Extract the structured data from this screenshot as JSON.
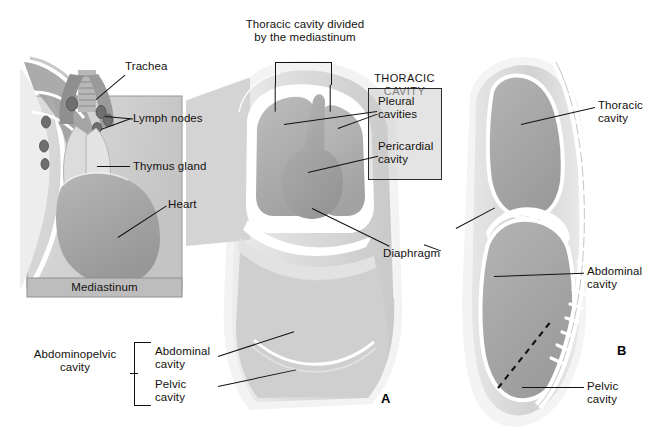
{
  "figure": {
    "title_note": "Body cavities: thoracic, abdominopelvic and mediastinum",
    "panel_a_letter": "A",
    "panel_b_letter": "B"
  },
  "mediastinum_inset": {
    "caption": "Mediastinum",
    "labels": {
      "trachea": "Trachea",
      "lymph_nodes": "Lymph nodes",
      "thymus_gland": "Thymus gland",
      "heart": "Heart"
    }
  },
  "panel_a": {
    "bracket_label": "Thoracic cavity divided\nby the mediastinum",
    "thoracic_box": {
      "heading": "THORACIC CAVITY",
      "items": [
        "Pleural\ncavities",
        "Pericardial\ncavity"
      ]
    },
    "diaphragm_label": "Diaphragm",
    "abdominopelvic": {
      "group_label": "Abdominopelvic\ncavity",
      "sub_labels": [
        "Abdominal\ncavity",
        "Pelvic\ncavity"
      ]
    }
  },
  "panel_b": {
    "labels": [
      "Thoracic\ncavity",
      "Abdominal\ncavity",
      "Pelvic\ncavity"
    ]
  },
  "colors": {
    "ink": "#14120f",
    "leader": "#111111",
    "body_fill": "#d9d9d9",
    "cavity_fill": "#a9a9a9",
    "outline_white": "#ffffff",
    "inset_bg": "#d2d2d2",
    "caption_band": "#bfbfbf",
    "box_border": "#2b2b2b",
    "box_fill": "#cfcfcf"
  }
}
